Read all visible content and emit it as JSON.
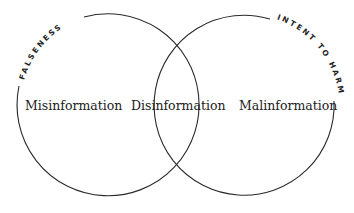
{
  "diagram": {
    "type": "venn",
    "circles": [
      {
        "id": "left",
        "arc_label": "FALSENESS"
      },
      {
        "id": "right",
        "arc_label": "INTENT TO HARM"
      }
    ],
    "regions": {
      "left_only": "Misinformation",
      "intersection": "Disinformation",
      "right_only": "Malinformation"
    },
    "colors": {
      "stroke": "#2a2a2a",
      "text": "#222222",
      "background": "#ffffff"
    }
  }
}
